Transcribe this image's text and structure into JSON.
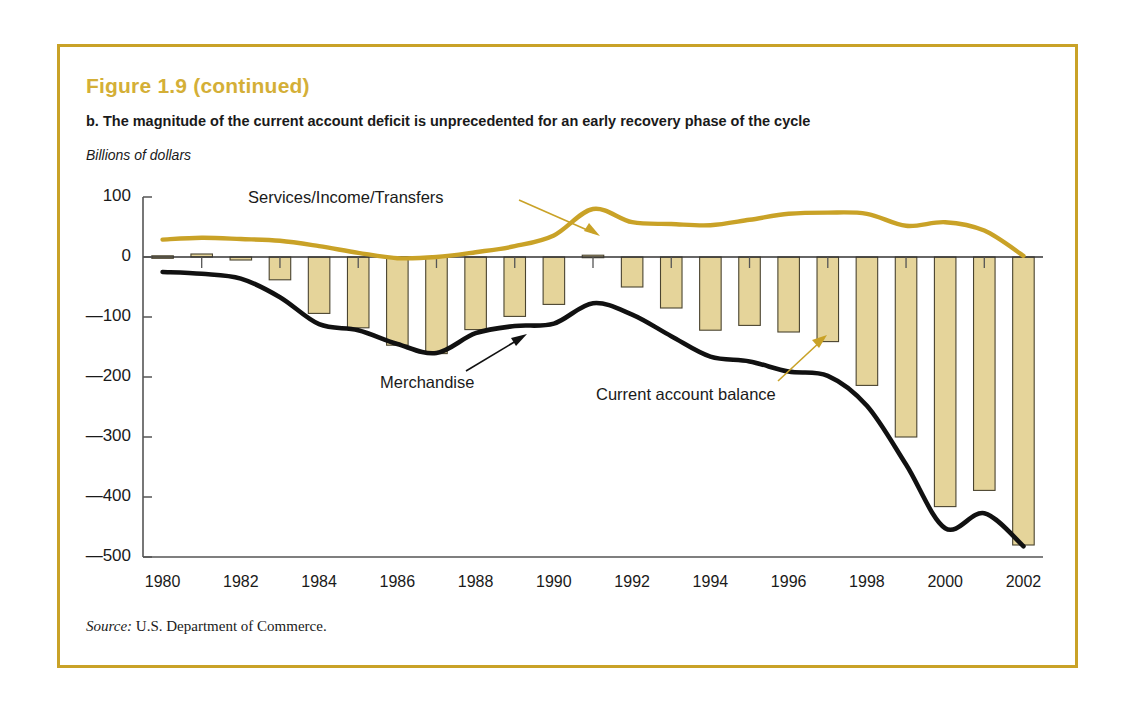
{
  "figure": {
    "title": "Figure 1.9  (continued)",
    "subtitle": "b. The magnitude of the current account deficit is unprecedented for an early recovery phase of the cycle",
    "units_label": "Billions of dollars",
    "source_label": "Source:",
    "source_text": " U.S. Department of Commerce.",
    "border_color": "#c9a227",
    "title_color": "#d4af37"
  },
  "annotations": [
    {
      "name": "services-income-transfers",
      "text": "Services/Income/Transfers",
      "x": 248,
      "y": 188,
      "color": "#1a1a1a"
    },
    {
      "name": "merchandise",
      "text": "Merchandise",
      "x": 380,
      "y": 373,
      "color": "#1a1a1a"
    },
    {
      "name": "current-account-balance",
      "text": "Current account balance",
      "x": 596,
      "y": 385,
      "color": "#1a1a1a"
    }
  ],
  "chart_data": {
    "type": "bar",
    "title": "The magnitude of the current account deficit is unprecedented for an early recovery phase of the cycle",
    "xlabel": "",
    "ylabel": "Billions of dollars",
    "ylim": [
      -500,
      100
    ],
    "xlim": [
      1979.5,
      2002.5
    ],
    "yticks": [
      100,
      0,
      -100,
      -200,
      -300,
      -400,
      -500
    ],
    "ytick_labels": [
      "100",
      "0",
      "—100",
      "—200",
      "—300",
      "—400",
      "—500"
    ],
    "xticks": [
      1980,
      1982,
      1984,
      1986,
      1988,
      1990,
      1992,
      1994,
      1996,
      1998,
      2000,
      2002
    ],
    "xtick_labels": [
      "1980",
      "1982",
      "1984",
      "1986",
      "1988",
      "1990",
      "1992",
      "1994",
      "1996",
      "1998",
      "2000",
      "2002"
    ],
    "grid": false,
    "legend_position": "none",
    "x": [
      1980,
      1981,
      1982,
      1983,
      1984,
      1985,
      1986,
      1987,
      1988,
      1989,
      1990,
      1991,
      1992,
      1993,
      1994,
      1995,
      1996,
      1997,
      1998,
      1999,
      2000,
      2001,
      2002
    ],
    "series": [
      {
        "name": "Current account balance",
        "kind": "bar",
        "color": "#e5d49a",
        "edge_color": "#4a4430",
        "values": [
          2,
          5,
          -5,
          -38,
          -94,
          -118,
          -147,
          -161,
          -121,
          -99,
          -79,
          3,
          -50,
          -85,
          -122,
          -114,
          -125,
          -141,
          -214,
          -300,
          -416,
          -389,
          -480
        ]
      },
      {
        "name": "Merchandise",
        "kind": "line",
        "color": "#111111",
        "values": [
          -25,
          -28,
          -36,
          -67,
          -112,
          -122,
          -145,
          -160,
          -127,
          -115,
          -111,
          -77,
          -96,
          -132,
          -166,
          -174,
          -191,
          -198,
          -248,
          -346,
          -452,
          -427,
          -482
        ]
      },
      {
        "name": "Services/Income/Transfers",
        "kind": "line",
        "color": "#c9a227",
        "values": [
          29,
          32,
          30,
          27,
          18,
          7,
          -2,
          0,
          8,
          18,
          36,
          80,
          58,
          55,
          53,
          62,
          72,
          74,
          72,
          52,
          58,
          44,
          2
        ]
      }
    ]
  }
}
